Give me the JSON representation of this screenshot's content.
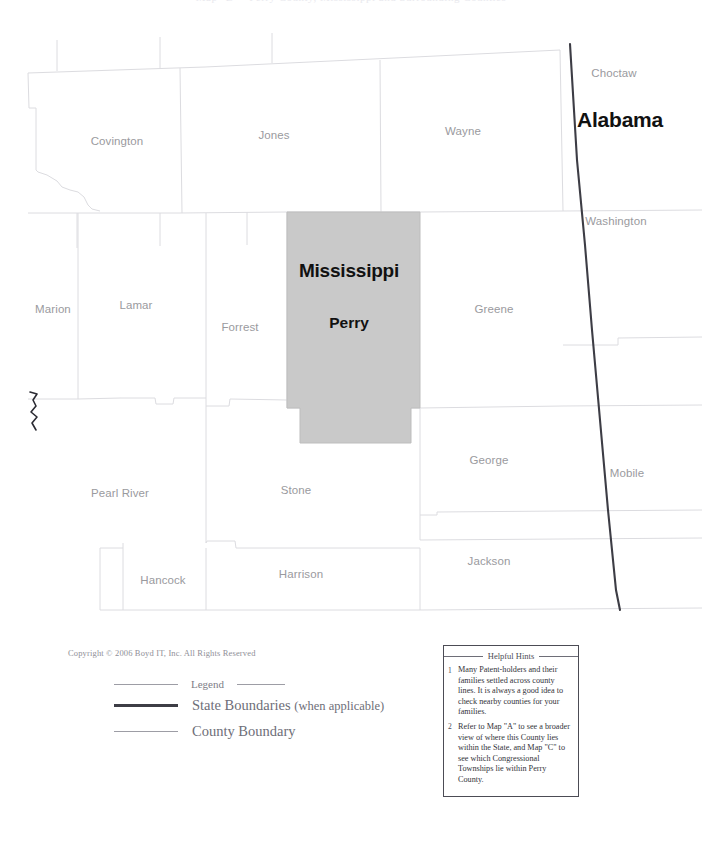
{
  "page": {
    "title_sliver": "Map \"B\"  -  Perry County, Mississippi and Surrounding Counties"
  },
  "map": {
    "selected": {
      "state": "Mississippi",
      "county": "Perry",
      "fill_color": "#c9c9c9"
    },
    "colors": {
      "county_line": "#dcdce0",
      "state_line": "#3d3d45",
      "county_label": "#9a9a9e"
    },
    "counties": [
      {
        "name": "Covington",
        "x": 117,
        "y": 141
      },
      {
        "name": "Jones",
        "x": 274,
        "y": 135
      },
      {
        "name": "Wayne",
        "x": 463,
        "y": 131
      },
      {
        "name": "Choctaw",
        "x": 614,
        "y": 73
      },
      {
        "name": "Washington",
        "x": 616,
        "y": 221
      },
      {
        "name": "Marion",
        "x": 53,
        "y": 309
      },
      {
        "name": "Lamar",
        "x": 136,
        "y": 305
      },
      {
        "name": "Forrest",
        "x": 240,
        "y": 327
      },
      {
        "name": "Greene",
        "x": 494,
        "y": 309
      },
      {
        "name": "Mobile",
        "x": 627,
        "y": 473
      },
      {
        "name": "George",
        "x": 489,
        "y": 460
      },
      {
        "name": "Pearl River",
        "x": 120,
        "y": 493
      },
      {
        "name": "Stone",
        "x": 296,
        "y": 490
      },
      {
        "name": "Jackson",
        "x": 489,
        "y": 561
      },
      {
        "name": "Hancock",
        "x": 163,
        "y": 580
      },
      {
        "name": "Harrison",
        "x": 301,
        "y": 574
      }
    ],
    "states": [
      {
        "name": "Alabama",
        "x": 620,
        "y": 120
      }
    ],
    "selected_labels": [
      {
        "text": "Mississippi",
        "x": 349,
        "y": 271
      },
      {
        "text": "Perry",
        "x": 349,
        "y": 323
      }
    ]
  },
  "footer": {
    "copyright": "Copyright © 2006  Boyd IT, Inc.  All Rights Reserved",
    "legend": {
      "title": "Legend",
      "rows": [
        {
          "label": "State Boundaries ",
          "suffix": "(when applicable)",
          "style": "state"
        },
        {
          "label": "County Boundary",
          "suffix": "",
          "style": "county"
        }
      ]
    }
  },
  "hints": {
    "title": "Helpful Hints",
    "items": [
      {
        "num": "1",
        "text": "Many Patent-holders and their families settled across county lines. It is always a good idea to check nearby counties for your families."
      },
      {
        "num": "2",
        "text": "Refer to Map \"A\" to see a broader view of where this County lies within the State, and Map \"C\" to see which Congressional Townships lie within Perry County."
      }
    ]
  }
}
